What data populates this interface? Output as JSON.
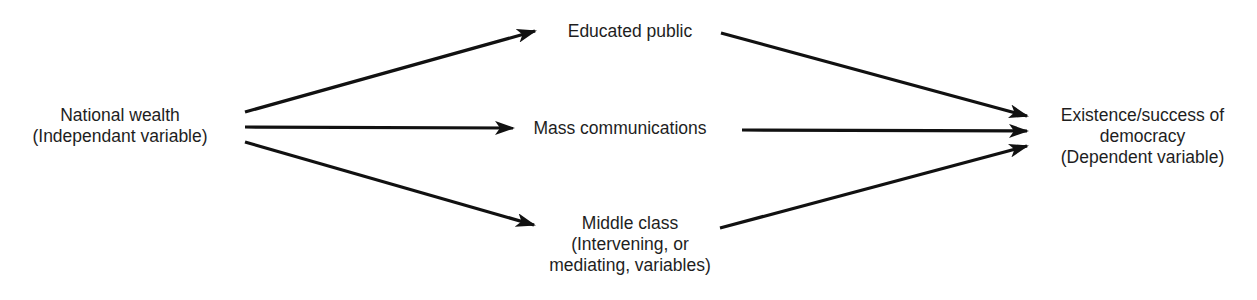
{
  "diagram": {
    "type": "causal-path-diagram",
    "stroke_color": "#111111",
    "text_color": "#1e1e1e",
    "nodes": {
      "independent": {
        "line1": "National wealth",
        "line2": "(Independant variable)"
      },
      "educated_public": {
        "line1": "Educated public"
      },
      "mass_communications": {
        "line1": "Mass communications"
      },
      "middle_class": {
        "line1": "Middle class",
        "line2": "(Intervening, or",
        "line3": "mediating, variables)"
      },
      "dependent": {
        "line1": "Existence/success of",
        "line2": "democracy",
        "line3": "(Dependent variable)"
      }
    },
    "edges": [
      {
        "from": "National wealth",
        "to": "Educated public"
      },
      {
        "from": "National wealth",
        "to": "Mass communications"
      },
      {
        "from": "National wealth",
        "to": "Middle class"
      },
      {
        "from": "Educated public",
        "to": "Existence/success of democracy"
      },
      {
        "from": "Mass communications",
        "to": "Existence/success of democracy"
      },
      {
        "from": "Middle class",
        "to": "Existence/success of democracy"
      }
    ]
  }
}
